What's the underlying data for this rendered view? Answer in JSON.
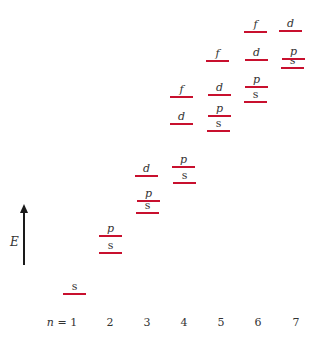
{
  "axis": {
    "label": "E",
    "direction": "up"
  },
  "colors": {
    "level_line": "#c8102e",
    "text": "#333333",
    "arrow": "#1a1a1a"
  },
  "n_labels": [
    {
      "var": "n",
      "eq": " = ",
      "value": "1",
      "x": 62
    },
    {
      "var": "",
      "eq": "",
      "value": "2",
      "x": 110
    },
    {
      "var": "",
      "eq": "",
      "value": "3",
      "x": 147
    },
    {
      "var": "",
      "eq": "",
      "value": "4",
      "x": 184
    },
    {
      "var": "",
      "eq": "",
      "value": "5",
      "x": 221
    },
    {
      "var": "",
      "eq": "",
      "value": "6",
      "x": 258
    },
    {
      "var": "",
      "eq": "",
      "value": "7",
      "x": 296
    }
  ],
  "levels": [
    {
      "n": 1,
      "sub": "s",
      "x": 63,
      "y": 293
    },
    {
      "n": 2,
      "sub": "s",
      "x": 99,
      "y": 252
    },
    {
      "n": 2,
      "sub": "p",
      "x": 99,
      "y": 235
    },
    {
      "n": 3,
      "sub": "s",
      "x": 136,
      "y": 212
    },
    {
      "n": 3,
      "sub": "p",
      "x": 137,
      "y": 200
    },
    {
      "n": 3,
      "sub": "d",
      "x": 135,
      "y": 175
    },
    {
      "n": 4,
      "sub": "s",
      "x": 173,
      "y": 182
    },
    {
      "n": 4,
      "sub": "p",
      "x": 172,
      "y": 166
    },
    {
      "n": 4,
      "sub": "d",
      "x": 170,
      "y": 123
    },
    {
      "n": 4,
      "sub": "f",
      "x": 170,
      "y": 96
    },
    {
      "n": 5,
      "sub": "s",
      "x": 207,
      "y": 130
    },
    {
      "n": 5,
      "sub": "p",
      "x": 208,
      "y": 115
    },
    {
      "n": 5,
      "sub": "d",
      "x": 208,
      "y": 94
    },
    {
      "n": 5,
      "sub": "f",
      "x": 206,
      "y": 60
    },
    {
      "n": 6,
      "sub": "s",
      "x": 244,
      "y": 101
    },
    {
      "n": 6,
      "sub": "p",
      "x": 245,
      "y": 86
    },
    {
      "n": 6,
      "sub": "d",
      "x": 245,
      "y": 59
    },
    {
      "n": 6,
      "sub": "f",
      "x": 244,
      "y": 31
    },
    {
      "n": 7,
      "sub": "s",
      "x": 281,
      "y": 67
    },
    {
      "n": 7,
      "sub": "p",
      "x": 282,
      "y": 58
    },
    {
      "n": 7,
      "sub": "d",
      "x": 279,
      "y": 30
    }
  ]
}
